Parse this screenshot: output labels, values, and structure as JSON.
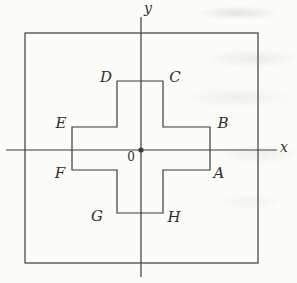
{
  "figure": {
    "background_color": "#fbfbf8",
    "line_color": "#3d3d3d",
    "labels": {
      "x_axis": "x",
      "y_axis": "y",
      "origin": "0",
      "vertices": {
        "A": "A",
        "B": "B",
        "C": "C",
        "D": "D",
        "E": "E",
        "F": "F",
        "G": "G",
        "H": "H"
      }
    }
  }
}
